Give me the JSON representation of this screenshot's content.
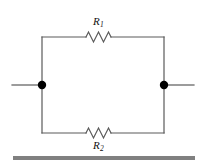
{
  "figure": {
    "kind": "circuit-diagram",
    "width": 204,
    "height": 166,
    "background_color": "#ffffff"
  },
  "labels": {
    "r1": {
      "symbol": "R",
      "subscript": "1"
    },
    "r2": {
      "symbol": "R",
      "subscript": "2"
    }
  },
  "components": [
    {
      "name": "resistor-top",
      "label_symbol": "R",
      "label_subscript": "1",
      "label_position": "above",
      "zigzag_peaks": 3,
      "branch": "top"
    },
    {
      "name": "resistor-bottom",
      "label_symbol": "R",
      "label_subscript": "2",
      "label_position": "below",
      "zigzag_peaks": 3,
      "branch": "bottom"
    }
  ],
  "nodes": [
    {
      "name": "terminal-node-left",
      "x": 42,
      "y": 85,
      "filled": true
    },
    {
      "name": "terminal-node-right",
      "x": 164,
      "y": 85,
      "filled": true
    }
  ],
  "leads": [
    {
      "name": "lead-left",
      "from_x": 12,
      "to_x": 42,
      "y": 85
    },
    {
      "name": "lead-right",
      "from_x": 164,
      "to_x": 194,
      "y": 85
    }
  ],
  "geometry": {
    "rect_left": 42,
    "rect_right": 164,
    "rect_top": 37,
    "rect_bottom": 133,
    "wire_color": "#5a5a5a",
    "wire_width": 1.2,
    "node_radius": 4.2,
    "node_color": "#000000"
  },
  "rule": {
    "name": "bottom-rule",
    "color": "#808080",
    "left": 13,
    "top": 156,
    "width": 182,
    "height": 4
  }
}
